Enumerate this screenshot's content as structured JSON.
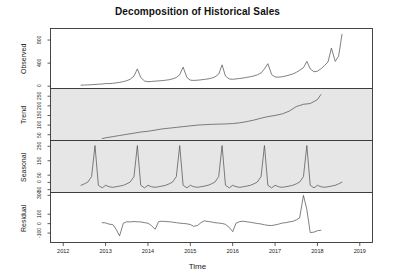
{
  "chart_data": {
    "type": "line",
    "title": "Decomposition of Historical Sales",
    "xlabel": "Time",
    "ylabel": "",
    "grid": false,
    "legend": "none",
    "xlim": [
      2011.7,
      2019.3
    ],
    "xticks": [
      2012,
      2013,
      2014,
      2015,
      2016,
      2017,
      2018,
      2019
    ],
    "xticklabels": [
      "2012",
      "2013",
      "2014",
      "2015",
      "2016",
      "2017",
      "2018",
      "2019"
    ],
    "panels": [
      {
        "name": "observed",
        "label": "Observed",
        "background": "#ffffff",
        "ylim": [
          -40,
          1000
        ],
        "yticks": [
          0,
          400,
          800
        ],
        "yticklabels": [
          "0",
          "400",
          "800"
        ],
        "x": [
          2012.42,
          2012.5,
          2012.58,
          2012.67,
          2012.75,
          2012.83,
          2012.92,
          2013.0,
          2013.08,
          2013.17,
          2013.25,
          2013.33,
          2013.42,
          2013.5,
          2013.58,
          2013.67,
          2013.75,
          2013.83,
          2013.92,
          2014.0,
          2014.08,
          2014.17,
          2014.25,
          2014.33,
          2014.42,
          2014.5,
          2014.58,
          2014.67,
          2014.75,
          2014.83,
          2014.92,
          2015.0,
          2015.08,
          2015.17,
          2015.25,
          2015.33,
          2015.42,
          2015.5,
          2015.58,
          2015.67,
          2015.75,
          2015.83,
          2015.92,
          2016.0,
          2016.08,
          2016.17,
          2016.25,
          2016.33,
          2016.42,
          2016.5,
          2016.58,
          2016.67,
          2016.75,
          2016.83,
          2016.92,
          2017.0,
          2017.08,
          2017.17,
          2017.25,
          2017.33,
          2017.42,
          2017.5,
          2017.58,
          2017.67,
          2017.75,
          2017.83,
          2017.92,
          2018.0,
          2018.08,
          2018.17,
          2018.25,
          2018.33,
          2018.42,
          2018.5,
          2018.58
        ],
        "y": [
          18,
          20,
          22,
          26,
          30,
          34,
          38,
          46,
          44,
          50,
          58,
          66,
          80,
          95,
          120,
          175,
          300,
          150,
          90,
          78,
          82,
          88,
          92,
          96,
          104,
          112,
          126,
          150,
          200,
          330,
          150,
          105,
          100,
          104,
          110,
          118,
          126,
          140,
          160,
          210,
          370,
          175,
          125,
          120,
          126,
          134,
          142,
          152,
          164,
          178,
          196,
          230,
          300,
          390,
          200,
          160,
          156,
          164,
          176,
          192,
          212,
          240,
          275,
          320,
          430,
          300,
          250,
          260,
          300,
          360,
          420,
          660,
          430,
          520,
          900
        ]
      },
      {
        "name": "trend",
        "label": "Trend",
        "background": "#e6e6e6",
        "ylim": [
          20,
          290
        ],
        "yticks": [
          50,
          100,
          150,
          200,
          250
        ],
        "yticklabels": [
          "50",
          "100",
          "150",
          "200",
          "250"
        ],
        "x": [
          2012.92,
          2013.0,
          2013.17,
          2013.33,
          2013.5,
          2013.67,
          2013.83,
          2014.0,
          2014.17,
          2014.33,
          2014.5,
          2014.67,
          2014.83,
          2015.0,
          2015.17,
          2015.33,
          2015.5,
          2015.67,
          2015.83,
          2016.0,
          2016.17,
          2016.33,
          2016.5,
          2016.67,
          2016.83,
          2017.0,
          2017.17,
          2017.33,
          2017.5,
          2017.67,
          2017.83,
          2018.0,
          2018.08
        ],
        "y": [
          30,
          34,
          40,
          46,
          52,
          58,
          64,
          68,
          74,
          80,
          84,
          88,
          92,
          96,
          100,
          102,
          104,
          105,
          106,
          108,
          112,
          118,
          126,
          136,
          144,
          150,
          158,
          172,
          196,
          208,
          212,
          232,
          258
        ]
      },
      {
        "name": "seasonal",
        "label": "Seasonal",
        "background": "#e6e6e6",
        "ylim": [
          -70,
          290
        ],
        "yticks": [
          -50,
          0,
          50,
          150,
          250
        ],
        "yticklabels": [
          "-50",
          "0",
          "50",
          "150",
          "250"
        ],
        "period_months": 12,
        "seasonal_profile": [
          -38,
          -20,
          -30,
          -34,
          -30,
          -26,
          -20,
          -10,
          2,
          40,
          255,
          -20
        ],
        "x": [
          2012.42,
          2012.5,
          2012.58,
          2012.67,
          2012.75,
          2012.83,
          2012.92,
          2013.0,
          2013.08,
          2013.17,
          2013.25,
          2013.33,
          2013.42,
          2013.5,
          2013.58,
          2013.67,
          2013.75,
          2013.83,
          2013.92,
          2014.0,
          2014.08,
          2014.17,
          2014.25,
          2014.33,
          2014.42,
          2014.5,
          2014.58,
          2014.67,
          2014.75,
          2014.83,
          2014.92,
          2015.0,
          2015.08,
          2015.17,
          2015.25,
          2015.33,
          2015.42,
          2015.5,
          2015.58,
          2015.67,
          2015.75,
          2015.83,
          2015.92,
          2016.0,
          2016.08,
          2016.17,
          2016.25,
          2016.33,
          2016.42,
          2016.5,
          2016.58,
          2016.67,
          2016.75,
          2016.83,
          2016.92,
          2017.0,
          2017.08,
          2017.17,
          2017.25,
          2017.33,
          2017.42,
          2017.5,
          2017.58,
          2017.67,
          2017.75,
          2017.83,
          2017.92,
          2018.0,
          2018.08,
          2018.17,
          2018.25,
          2018.33,
          2018.42,
          2018.5,
          2018.58
        ],
        "y": [
          -20,
          -10,
          2,
          40,
          255,
          -20,
          -38,
          -20,
          -30,
          -34,
          -30,
          -26,
          -20,
          -10,
          2,
          40,
          255,
          -20,
          -38,
          -20,
          -30,
          -34,
          -30,
          -26,
          -20,
          -10,
          2,
          40,
          255,
          -20,
          -38,
          -20,
          -30,
          -34,
          -30,
          -26,
          -20,
          -10,
          2,
          40,
          255,
          -20,
          -38,
          -20,
          -30,
          -34,
          -30,
          -26,
          -20,
          -10,
          2,
          40,
          255,
          -20,
          -38,
          -20,
          -30,
          -34,
          -30,
          -26,
          -20,
          -10,
          2,
          40,
          255,
          -20,
          -38,
          -20,
          -30,
          -34,
          -30,
          -26,
          -20,
          -10,
          2
        ]
      },
      {
        "name": "residual",
        "label": "Residual",
        "background": "#ffffff",
        "ylim": [
          -200,
          330
        ],
        "yticks": [
          -100,
          0,
          100,
          300
        ],
        "yticklabels": [
          "-100",
          "0",
          "100",
          "300"
        ],
        "x": [
          2012.92,
          2013.0,
          2013.08,
          2013.17,
          2013.25,
          2013.33,
          2013.42,
          2013.5,
          2013.58,
          2013.67,
          2013.75,
          2013.83,
          2013.92,
          2014.0,
          2014.08,
          2014.17,
          2014.25,
          2014.33,
          2014.42,
          2014.5,
          2014.58,
          2014.67,
          2014.75,
          2014.83,
          2014.92,
          2015.0,
          2015.08,
          2015.17,
          2015.25,
          2015.33,
          2015.42,
          2015.5,
          2015.58,
          2015.67,
          2015.75,
          2015.83,
          2015.92,
          2016.0,
          2016.08,
          2016.17,
          2016.25,
          2016.33,
          2016.42,
          2016.5,
          2016.58,
          2016.67,
          2016.75,
          2016.83,
          2016.92,
          2017.0,
          2017.08,
          2017.17,
          2017.25,
          2017.33,
          2017.42,
          2017.5,
          2017.58,
          2017.67,
          2017.75,
          2017.83,
          2017.92,
          2018.0,
          2018.08
        ],
        "y": [
          10,
          8,
          -5,
          -10,
          -60,
          -130,
          5,
          20,
          18,
          22,
          20,
          18,
          10,
          5,
          -20,
          -60,
          20,
          26,
          22,
          20,
          16,
          10,
          5,
          2,
          -2,
          -10,
          -28,
          -20,
          10,
          30,
          22,
          18,
          10,
          6,
          2,
          -8,
          -40,
          -85,
          5,
          22,
          25,
          20,
          14,
          8,
          2,
          -4,
          -12,
          -18,
          -20,
          -14,
          -6,
          6,
          10,
          18,
          24,
          40,
          60,
          300,
          150,
          -95,
          -90,
          -75,
          -70
        ]
      }
    ]
  }
}
